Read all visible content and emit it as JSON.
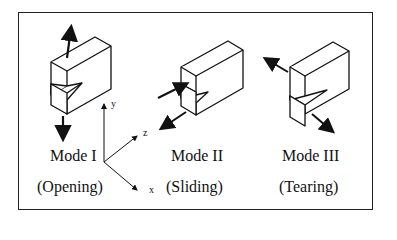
{
  "diagram": {
    "modes": [
      {
        "name": "Mode I",
        "description": "(Opening)"
      },
      {
        "name": "Mode II",
        "description": "(Sliding)"
      },
      {
        "name": "Mode III",
        "description": "(Tearing)"
      }
    ],
    "axes": {
      "x": "x",
      "y": "y",
      "z": "z"
    }
  }
}
